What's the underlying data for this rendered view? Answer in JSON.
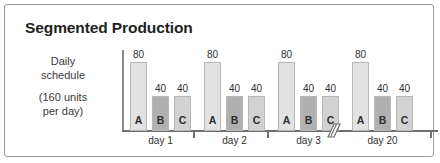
{
  "figure": {
    "title": "Segmented Production",
    "border_color": "#9b9b9b",
    "background": "#ffffff"
  },
  "y_caption": {
    "line1": "Daily",
    "line2": "schedule",
    "line3": "(160 units",
    "line4": "per day)"
  },
  "axis": {
    "break_symbol": "axis-break-icon"
  },
  "chart_data": {
    "type": "bar",
    "title": "Segmented Production",
    "xlabel": "",
    "ylabel": "Daily schedule (160 units per day)",
    "ylim": [
      0,
      88
    ],
    "grid": false,
    "legend": "none",
    "categories": [
      "day 1",
      "day 2",
      "day 3",
      "day 20"
    ],
    "series": [
      {
        "name": "A",
        "values": [
          80,
          80,
          80,
          80
        ],
        "color": "#e2e2e2"
      },
      {
        "name": "B",
        "values": [
          40,
          40,
          40,
          40
        ],
        "color": "#b0b0b0"
      },
      {
        "name": "C",
        "values": [
          40,
          40,
          40,
          40
        ],
        "color": "#d2d2d2"
      }
    ],
    "groups": [
      {
        "label": "day 1",
        "bars": [
          {
            "letter": "A",
            "value": "80",
            "height": 80,
            "color": "#e2e2e2"
          },
          {
            "letter": "B",
            "value": "40",
            "height": 40,
            "color": "#b0b0b0"
          },
          {
            "letter": "C",
            "value": "40",
            "height": 40,
            "color": "#d2d2d2"
          }
        ]
      },
      {
        "label": "day 2",
        "bars": [
          {
            "letter": "A",
            "value": "80",
            "height": 80,
            "color": "#e2e2e2"
          },
          {
            "letter": "B",
            "value": "40",
            "height": 40,
            "color": "#b0b0b0"
          },
          {
            "letter": "C",
            "value": "40",
            "height": 40,
            "color": "#d2d2d2"
          }
        ]
      },
      {
        "label": "day 3",
        "bars": [
          {
            "letter": "A",
            "value": "80",
            "height": 80,
            "color": "#e2e2e2"
          },
          {
            "letter": "B",
            "value": "40",
            "height": 40,
            "color": "#b0b0b0"
          },
          {
            "letter": "C",
            "value": "40",
            "height": 40,
            "color": "#d2d2d2"
          }
        ]
      },
      {
        "label": "day 20",
        "bars": [
          {
            "letter": "A",
            "value": "80",
            "height": 80,
            "color": "#e2e2e2"
          },
          {
            "letter": "B",
            "value": "40",
            "height": 40,
            "color": "#b0b0b0"
          },
          {
            "letter": "C",
            "value": "40",
            "height": 40,
            "color": "#d2d2d2"
          }
        ]
      }
    ]
  }
}
